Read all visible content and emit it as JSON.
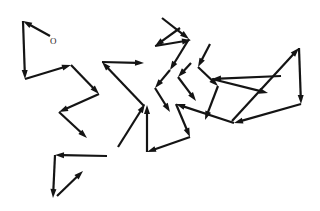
{
  "figure": {
    "background_color": "#ffffff",
    "stroke_color": "#141414",
    "width": 320,
    "height": 211
  },
  "origin": {
    "label": "O",
    "x": 50,
    "y": 37,
    "marker": "text-label"
  },
  "chart_data": {
    "type": "line",
    "xlabel": "",
    "ylabel": "",
    "xlim": [
      0,
      320
    ],
    "ylim": [
      0,
      211
    ],
    "grid": false,
    "legend": "none",
    "annotations": [
      {
        "text": "O",
        "x": 50,
        "y": 37
      }
    ],
    "series": [
      {
        "name": "path",
        "marker": "arrowhead-at-each-vertex",
        "points": [
          [
            50,
            36
          ],
          [
            23,
            21
          ],
          [
            25,
            79
          ],
          [
            71,
            65
          ],
          [
            99,
            94
          ],
          [
            59,
            112
          ],
          [
            87,
            138
          ],
          [
            107,
            156
          ],
          [
            55,
            155
          ],
          [
            53,
            198
          ],
          [
            83,
            171
          ],
          [
            116,
            145
          ],
          [
            144,
            106
          ],
          [
            127,
            95
          ],
          [
            102,
            62
          ],
          [
            144,
            63
          ],
          [
            133,
            78
          ],
          [
            152,
            52
          ],
          [
            168,
            22
          ],
          [
            190,
            40
          ],
          [
            178,
            72
          ],
          [
            155,
            88
          ],
          [
            171,
            112
          ],
          [
            191,
            135
          ],
          [
            207,
            45
          ],
          [
            198,
            67
          ],
          [
            218,
            86
          ],
          [
            234,
            118
          ],
          [
            268,
            92
          ],
          [
            211,
            78
          ],
          [
            301,
            47
          ],
          [
            302,
            106
          ],
          [
            234,
            123
          ],
          [
            176,
            104
          ],
          [
            190,
            137
          ],
          [
            147,
            152
          ],
          [
            147,
            105
          ]
        ]
      }
    ]
  },
  "segments": [
    {
      "name": "seg-01",
      "from": [
        50,
        36
      ],
      "to": [
        23,
        21
      ]
    },
    {
      "name": "seg-02",
      "from": [
        23,
        21
      ],
      "to": [
        25,
        79
      ]
    },
    {
      "name": "seg-03",
      "from": [
        25,
        79
      ],
      "to": [
        71,
        65
      ]
    },
    {
      "name": "seg-04",
      "from": [
        71,
        65
      ],
      "to": [
        99,
        94
      ]
    },
    {
      "name": "seg-05",
      "from": [
        99,
        94
      ],
      "to": [
        59,
        112
      ]
    },
    {
      "name": "seg-06",
      "from": [
        59,
        112
      ],
      "to": [
        87,
        138
      ]
    },
    {
      "name": "seg-07",
      "from": [
        107,
        156
      ],
      "to": [
        55,
        155
      ]
    },
    {
      "name": "seg-08",
      "from": [
        55,
        155
      ],
      "to": [
        53,
        198
      ]
    },
    {
      "name": "seg-09",
      "from": [
        57,
        196
      ],
      "to": [
        83,
        171
      ]
    },
    {
      "name": "seg-10",
      "from": [
        144,
        106
      ],
      "to": [
        102,
        62
      ]
    },
    {
      "name": "seg-11",
      "from": [
        102,
        62
      ],
      "to": [
        144,
        63
      ]
    },
    {
      "name": "seg-12",
      "from": [
        118,
        147
      ],
      "to": [
        145,
        104
      ]
    },
    {
      "name": "seg-13",
      "from": [
        147,
        152
      ],
      "to": [
        147,
        105
      ]
    },
    {
      "name": "seg-14",
      "from": [
        180,
        28
      ],
      "to": [
        155,
        46
      ]
    },
    {
      "name": "seg-15",
      "from": [
        155,
        46
      ],
      "to": [
        191,
        40
      ]
    },
    {
      "name": "seg-16",
      "from": [
        162,
        18
      ],
      "to": [
        189,
        39
      ]
    },
    {
      "name": "seg-17",
      "from": [
        189,
        39
      ],
      "to": [
        170,
        70
      ]
    },
    {
      "name": "seg-18",
      "from": [
        170,
        70
      ],
      "to": [
        155,
        88
      ]
    },
    {
      "name": "seg-19",
      "from": [
        155,
        88
      ],
      "to": [
        170,
        112
      ]
    },
    {
      "name": "seg-20",
      "from": [
        191,
        63
      ],
      "to": [
        178,
        77
      ]
    },
    {
      "name": "seg-21",
      "from": [
        178,
        77
      ],
      "to": [
        196,
        101
      ]
    },
    {
      "name": "seg-22",
      "from": [
        210,
        44
      ],
      "to": [
        198,
        67
      ]
    },
    {
      "name": "seg-23",
      "from": [
        198,
        67
      ],
      "to": [
        218,
        86
      ]
    },
    {
      "name": "seg-24",
      "from": [
        218,
        86
      ],
      "to": [
        205,
        120
      ]
    },
    {
      "name": "seg-25",
      "from": [
        281,
        76
      ],
      "to": [
        212,
        79
      ]
    },
    {
      "name": "seg-26",
      "from": [
        212,
        79
      ],
      "to": [
        268,
        93
      ]
    },
    {
      "name": "seg-27",
      "from": [
        232,
        121
      ],
      "to": [
        299,
        48
      ]
    },
    {
      "name": "seg-28",
      "from": [
        299,
        48
      ],
      "to": [
        301,
        104
      ]
    },
    {
      "name": "seg-29",
      "from": [
        301,
        104
      ],
      "to": [
        234,
        123
      ]
    },
    {
      "name": "seg-30",
      "from": [
        234,
        123
      ],
      "to": [
        176,
        104
      ]
    },
    {
      "name": "seg-31",
      "from": [
        176,
        104
      ],
      "to": [
        190,
        137
      ]
    },
    {
      "name": "seg-32",
      "from": [
        190,
        137
      ],
      "to": [
        147,
        152
      ]
    }
  ],
  "style": {
    "stroke_width": 2.2,
    "thin_stroke_width": 1.5,
    "arrow_length": 9,
    "arrow_width": 6
  }
}
